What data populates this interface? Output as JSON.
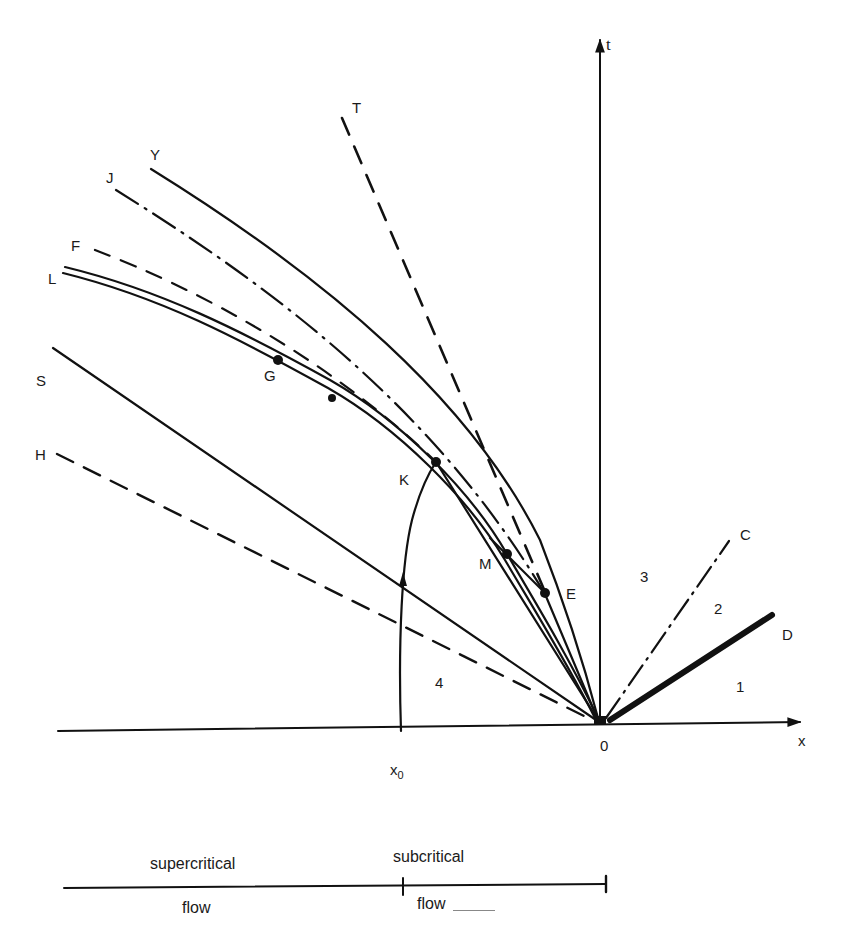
{
  "diagram": {
    "type": "x-t characteristic plane (open-channel flow)",
    "axes": {
      "x_label": "x",
      "t_label": "t",
      "origin_label": "0",
      "x0_label": "x",
      "x0_subscript": "0"
    },
    "curve_labels": {
      "T": "T",
      "Y": "Y",
      "J": "J",
      "F": "F",
      "L": "L",
      "S": "S",
      "H": "H",
      "C": "C",
      "D": "D"
    },
    "point_labels": {
      "G": "G",
      "K": "K",
      "M": "M",
      "E": "E"
    },
    "region_labels": {
      "r1": "1",
      "r2": "2",
      "r3": "3",
      "r4": "4"
    },
    "bottom_scale": {
      "left_top": "supercritical",
      "left_bottom": "flow",
      "right_top": "subcritical",
      "right_bottom": "flow"
    },
    "line_styles": {
      "T": "dashed",
      "Y": "solid",
      "J": "dash-dot",
      "F": "dashed",
      "L": "double solid",
      "S": "solid",
      "H": "dashed",
      "C": "dash-dot",
      "D": "thick solid"
    },
    "colors": {
      "ink": "#111111",
      "background": "#ffffff"
    }
  }
}
